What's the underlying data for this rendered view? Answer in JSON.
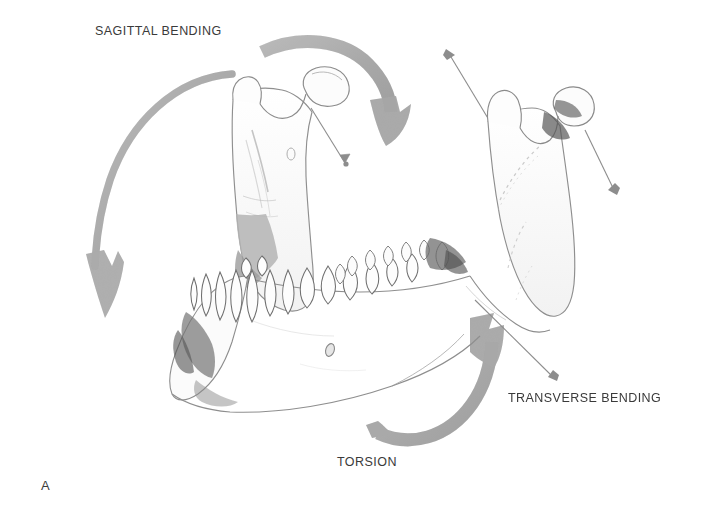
{
  "figure": {
    "panel_letter": "A",
    "background_color": "#ffffff",
    "width": 704,
    "height": 525,
    "labels": {
      "sagittal_bending": "SAGITTAL BENDING",
      "transverse_bending": "TRANSVERSE BENDING",
      "torsion": "TORSION"
    },
    "colors": {
      "label_text": "#3a3a3a",
      "thick_arrow": "#a9a9a9",
      "thick_arrow_dark": "#9a9a9a",
      "thin_arrow": "#8d8d8d",
      "bone_outline": "#8a8a8a",
      "bone_shadow": "#5e5e5e",
      "bone_fill": "#fdfdfd"
    },
    "arrows": [
      {
        "name": "sagittal-bending-left-arc",
        "style": "thick-curved",
        "direction": "counterclockwise-down"
      },
      {
        "name": "sagittal-bending-right-arc",
        "style": "thick-curved",
        "direction": "clockwise-down"
      },
      {
        "name": "torsion-arc",
        "style": "thick-curved",
        "direction": "counterclockwise-up"
      },
      {
        "name": "left-condyle-pointer",
        "style": "thin-line",
        "direction": "down-right"
      },
      {
        "name": "right-condyle-pointer",
        "style": "thin-line",
        "direction": "down-right"
      },
      {
        "name": "right-coronoid-pointer",
        "style": "thin-line",
        "direction": "up-left"
      },
      {
        "name": "transverse-bending-pointer",
        "style": "thin-line",
        "direction": "down-right"
      }
    ]
  }
}
